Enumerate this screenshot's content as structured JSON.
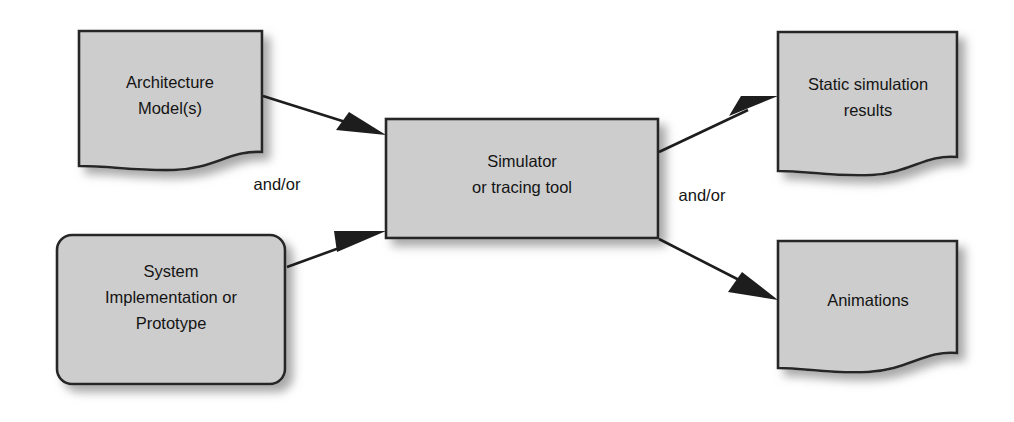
{
  "diagram": {
    "background_color": "#ffffff",
    "shape_fill": "#cdcdcd",
    "shape_stroke": "#262626",
    "text_color": "#141414",
    "arrow_color": "#1d1d1d",
    "nodes": [
      {
        "id": "architecture-model",
        "shape": "document",
        "lines": [
          "Architecture",
          "Model(s)"
        ],
        "line1": "Architecture",
        "line2": "Model(s)"
      },
      {
        "id": "system-implementation",
        "shape": "rounded-rectangle",
        "lines": [
          "System",
          "Implementation or",
          "Prototype"
        ],
        "line1": "System",
        "line2": "Implementation or",
        "line3": "Prototype"
      },
      {
        "id": "simulator",
        "shape": "rectangle",
        "lines": [
          "Simulator",
          "or tracing tool"
        ],
        "line1": "Simulator",
        "line2": "or tracing tool"
      },
      {
        "id": "static-simulation-results",
        "shape": "document",
        "lines": [
          "Static simulation",
          "results"
        ],
        "line1": "Static simulation",
        "line2": "results"
      },
      {
        "id": "animations",
        "shape": "document",
        "lines": [
          "Animations"
        ],
        "line1": "Animations"
      }
    ],
    "edges": [
      {
        "id": "architecture-to-simulator",
        "from": "architecture-model",
        "to": "simulator",
        "label": ""
      },
      {
        "id": "implementation-to-simulator",
        "from": "system-implementation",
        "to": "simulator",
        "label": ""
      },
      {
        "id": "simulator-to-static-results",
        "from": "simulator",
        "to": "static-simulation-results",
        "label": ""
      },
      {
        "id": "simulator-to-animations",
        "from": "simulator",
        "to": "animations",
        "label": ""
      }
    ],
    "labels": {
      "input_andor": "and/or",
      "output_andor": "and/or"
    }
  }
}
